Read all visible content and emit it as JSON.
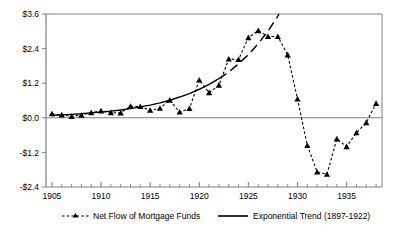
{
  "chart_data": {
    "type": "line",
    "title": "",
    "subtitle": "",
    "xlabel": "",
    "ylabel": "",
    "xlim": [
      1904.4,
      1938.6
    ],
    "ylim": [
      -2.4,
      3.6
    ],
    "grid": false,
    "legend_position": "bottom",
    "y_tick_labels": [
      "$3.6",
      "$2.4",
      "$1.2",
      "$0.0",
      "-$1.2",
      "-$2.4"
    ],
    "y_tick_values": [
      3.6,
      2.4,
      1.2,
      0.0,
      -1.2,
      -2.4
    ],
    "x_tick_labels": [
      "1905",
      "1910",
      "1915",
      "1920",
      "1925",
      "1930",
      "1935"
    ],
    "x_tick_values": [
      1905,
      1910,
      1915,
      1920,
      1925,
      1930,
      1935
    ],
    "x_minor_ticks": [
      1906,
      1907,
      1908,
      1909,
      1911,
      1912,
      1913,
      1914,
      1916,
      1917,
      1918,
      1919,
      1921,
      1922,
      1923,
      1924,
      1926,
      1927,
      1928,
      1929,
      1931,
      1932,
      1933,
      1934,
      1936,
      1937,
      1938
    ],
    "zero_line": 0.0,
    "series": [
      {
        "name": "Net Flow of Mortgage Funds",
        "style": "dashed-with-triangle-markers",
        "color": "#000000",
        "x": [
          1905,
          1906,
          1907,
          1908,
          1909,
          1910,
          1911,
          1912,
          1913,
          1914,
          1915,
          1916,
          1917,
          1918,
          1919,
          1920,
          1921,
          1922,
          1923,
          1924,
          1925,
          1926,
          1927,
          1928,
          1929,
          1930,
          1931,
          1932,
          1933,
          1934,
          1935,
          1936,
          1937,
          1938
        ],
        "values": [
          0.14,
          0.1,
          0.05,
          0.09,
          0.18,
          0.24,
          0.18,
          0.17,
          0.4,
          0.39,
          0.26,
          0.33,
          0.61,
          0.2,
          0.32,
          1.31,
          0.87,
          1.13,
          2.04,
          2.02,
          2.78,
          3.02,
          2.82,
          2.82,
          2.18,
          0.65,
          -0.96,
          -1.88,
          -1.96,
          -0.73,
          -1.0,
          -0.52,
          -0.17,
          0.5
        ]
      },
      {
        "name": "Exponential Trend (1897-1922)",
        "style": "solid-then-dashed",
        "color": "#000000",
        "x": [
          1905,
          1906,
          1907,
          1908,
          1909,
          1910,
          1911,
          1912,
          1913,
          1914,
          1915,
          1916,
          1917,
          1918,
          1919,
          1920,
          1921,
          1922,
          1923,
          1924,
          1925,
          1926,
          1927,
          1928,
          1929,
          1930,
          1931
        ],
        "values": [
          0.08,
          0.1,
          0.12,
          0.14,
          0.17,
          0.2,
          0.23,
          0.27,
          0.32,
          0.38,
          0.44,
          0.52,
          0.61,
          0.72,
          0.84,
          0.99,
          1.16,
          1.36,
          1.59,
          1.87,
          2.19,
          2.57,
          3.01,
          3.53,
          4.14,
          4.86,
          5.7
        ],
        "solid_until": 1922
      }
    ]
  },
  "legend": {
    "items": [
      {
        "label": "Net Flow of Mortgage Funds",
        "marker": "dashed-triangle"
      },
      {
        "label": "Exponential Trend (1897-1922)",
        "marker": "solid-line"
      }
    ]
  },
  "colors": {
    "axis": "#808080",
    "series": "#000000",
    "background": "#ffffff"
  }
}
